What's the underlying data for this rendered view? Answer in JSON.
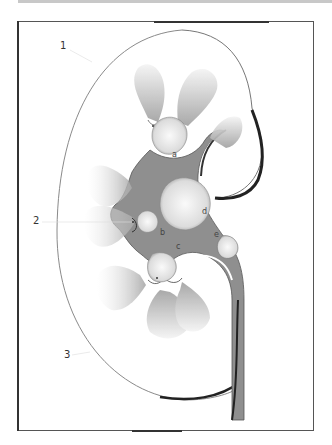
{
  "figure": {
    "labels": {
      "numbers": [
        {
          "id": "1",
          "text": "1"
        },
        {
          "id": "2",
          "text": "2"
        },
        {
          "id": "3",
          "text": "3"
        }
      ],
      "letters": [
        {
          "id": "a",
          "text": "a"
        },
        {
          "id": "b",
          "text": "b"
        },
        {
          "id": "c",
          "text": "c"
        },
        {
          "id": "d",
          "text": "d"
        },
        {
          "id": "e",
          "text": "e"
        }
      ]
    },
    "colors": {
      "background": "#ffffff",
      "pelvis": "#8a8a8a",
      "pyramid": "#bdbdbd",
      "stone": "#e6e6e6",
      "outline": "#333333",
      "frame": "#555555"
    }
  }
}
